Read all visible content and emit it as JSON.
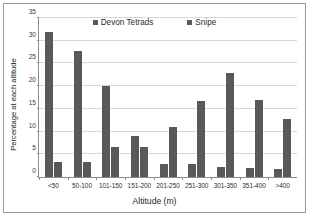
{
  "chart_data": {
    "type": "bar",
    "title": "",
    "xlabel": "Altitude (m)",
    "ylabel": "Percentage at each altitude",
    "categories": [
      "<50",
      "50-100",
      "101-150",
      "151-200",
      "201-250",
      "251-300",
      "301-350",
      "351-400",
      ">400"
    ],
    "series": [
      {
        "name": "Devon Tetrads",
        "color": "#595959",
        "values": [
          32.0,
          27.8,
          20.1,
          9.0,
          2.8,
          2.8,
          2.2,
          1.9,
          1.7
        ]
      },
      {
        "name": "Snipe",
        "color": "#595959",
        "values": [
          3.3,
          3.3,
          6.7,
          6.7,
          10.9,
          16.8,
          22.8,
          16.9,
          12.7
        ]
      }
    ],
    "ylim": [
      0,
      35
    ],
    "yticks": [
      0,
      5,
      10,
      15,
      20,
      25,
      30,
      35
    ],
    "ytick_labels": [
      "0",
      "5",
      "10",
      "15",
      "20",
      "25",
      "30",
      "35"
    ],
    "grid": true,
    "legend_position": "top-center"
  },
  "legend": {
    "entries": [
      {
        "label": "Devon Tetrads"
      },
      {
        "label": "Snipe"
      }
    ]
  }
}
